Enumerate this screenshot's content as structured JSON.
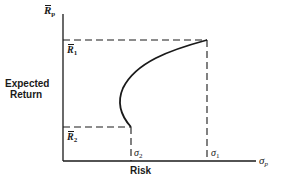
{
  "diagram": {
    "y_axis_label": {
      "symbol": "R",
      "sub": "p"
    },
    "y_axis_title_line1": "Expected",
    "y_axis_title_line2": "Return",
    "x_axis_label": {
      "symbol": "σ",
      "sub": "p"
    },
    "x_axis_title": "Risk",
    "levels": {
      "r1": {
        "symbol": "R",
        "sub": "1"
      },
      "r2": {
        "symbol": "R",
        "sub": "2"
      },
      "sigma1": {
        "symbol": "σ",
        "sub": "1"
      },
      "sigma2": {
        "symbol": "σ",
        "sub": "2"
      }
    },
    "colors": {
      "ink": "#1a1a1a",
      "background": "#ffffff"
    }
  }
}
